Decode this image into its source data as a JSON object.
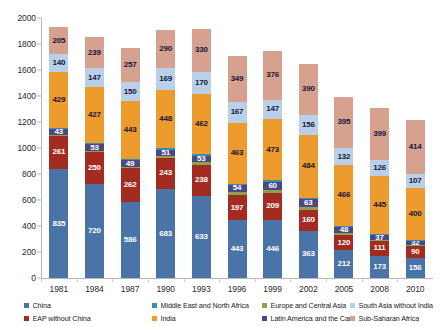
{
  "chart_data": {
    "type": "bar",
    "subtype": "stacked-vertical",
    "title": "",
    "subtitle": "",
    "xlabel": "",
    "ylabel": "",
    "ylim": [
      0,
      2000
    ],
    "ytick_step": 200,
    "yticks": [
      "0",
      "200",
      "400",
      "600",
      "800",
      "1000",
      "1200",
      "1400",
      "1600",
      "1800",
      "2000"
    ],
    "grid": false,
    "legend_position": "bottom",
    "categories": [
      "1981",
      "1984",
      "1987",
      "1990",
      "1993",
      "1996",
      "1999",
      "2002",
      "2005",
      "2008",
      "2010"
    ],
    "series": [
      {
        "name": "China",
        "color": "#4A73A8",
        "values": [
          835,
          720,
          586,
          683,
          633,
          443,
          446,
          363,
          212,
          173,
          156
        ]
      },
      {
        "name": "EAP without China",
        "color": "#A32B20",
        "values": [
          261,
          250,
          262,
          243,
          238,
          197,
          209,
          160,
          120,
          111,
          90
        ]
      },
      {
        "name": "Europe and Central Asia",
        "color": "#8DA34B",
        "values": [
          5,
          6,
          8,
          10,
          18,
          22,
          26,
          20,
          12,
          9,
          7
        ]
      },
      {
        "name": "Latin America and the Caribbean",
        "color": "#4B4885",
        "values": [
          43,
          53,
          49,
          51,
          53,
          54,
          60,
          63,
          48,
          37,
          32
        ]
      },
      {
        "name": "Middle East and North Africa",
        "color": "#368FB0",
        "values": [
          10,
          11,
          12,
          12,
          12,
          11,
          11,
          11,
          10,
          9,
          8
        ]
      },
      {
        "name": "India",
        "color": "#EE9B2E",
        "values": [
          429,
          427,
          443,
          448,
          462,
          463,
          473,
          484,
          466,
          445,
          400
        ]
      },
      {
        "name": "South Asia without India",
        "color": "#BAD0E8",
        "values": [
          140,
          147,
          150,
          169,
          170,
          167,
          147,
          156,
          132,
          126,
          107
        ]
      },
      {
        "name": "Sub-Saharan Africa",
        "color": "#D7A190",
        "values": [
          205,
          239,
          257,
          290,
          330,
          349,
          376,
          390,
          395,
          399,
          414
        ]
      }
    ],
    "labeled_series": [
      "China",
      "EAP without China",
      "Latin America and the Caribbean",
      "India",
      "South Asia without India",
      "Sub-Saharan Africa"
    ],
    "bar_totals": [
      1928,
      1853,
      1767,
      1906,
      1916,
      1706,
      1748,
      1647,
      1395,
      1309,
      1214
    ]
  },
  "legend": {
    "items": [
      {
        "label": "China",
        "color": "#4A73A8"
      },
      {
        "label": "EAP without China",
        "color": "#A32B20"
      },
      {
        "label": "Europe and Central Asia",
        "color": "#8DA34B"
      },
      {
        "label": "Latin America and the Caribbean",
        "color": "#4B4885"
      },
      {
        "label": "Middle East and North Africa",
        "color": "#368FB0"
      },
      {
        "label": "India",
        "color": "#EE9B2E"
      },
      {
        "label": "South Asia without India",
        "color": "#BAD0E8"
      },
      {
        "label": "Sub-Saharan Africa",
        "color": "#D7A190"
      }
    ]
  }
}
